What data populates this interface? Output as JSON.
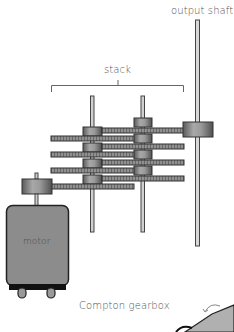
{
  "diagram": {
    "title": "Compton gearbox",
    "labels": {
      "output_shaft": "output shaft",
      "stack": "stack",
      "motor": "motor",
      "caption": "Compton gearbox"
    },
    "components": [
      "motor",
      "motor pinion",
      "stack shaft 1",
      "stack shaft 2",
      "compound gears x8",
      "output shaft",
      "output gear"
    ],
    "colors": {
      "gear_fill": "#8a8a8a",
      "gear_dark": "#555555",
      "motor_body": "#8c8c8c",
      "shaft": "#cfcfcf",
      "outline": "#333333"
    }
  }
}
